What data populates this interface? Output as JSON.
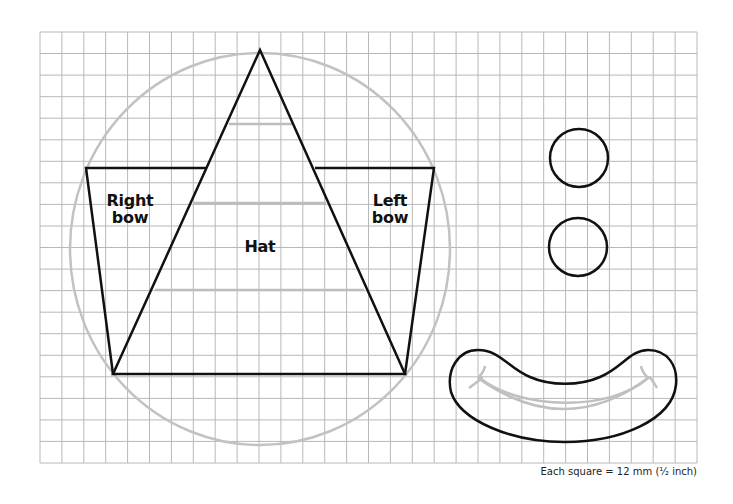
{
  "diagram": {
    "type": "pattern-template",
    "grid": {
      "cols": 30,
      "rows": 20,
      "left": 40,
      "top": 32,
      "right": 697,
      "bottom": 463,
      "line_color": "#b8b8b8"
    },
    "colors": {
      "outline": "#111111",
      "guide": "#bdbdbd",
      "background": "#ffffff"
    },
    "pieces": [
      {
        "id": "hat",
        "label": "Hat"
      },
      {
        "id": "right-bow",
        "label_line1": "Right",
        "label_line2": "bow"
      },
      {
        "id": "left-bow",
        "label_line1": "Left",
        "label_line2": "bow"
      },
      {
        "id": "eye-top"
      },
      {
        "id": "eye-bottom"
      },
      {
        "id": "mouth"
      }
    ],
    "labels": {
      "hat": "Hat",
      "right_bow_1": "Right",
      "right_bow_2": "bow",
      "left_bow_1": "Left",
      "left_bow_2": "bow"
    },
    "caption": "Each square = 12 mm (¹⁄₂ inch)"
  }
}
